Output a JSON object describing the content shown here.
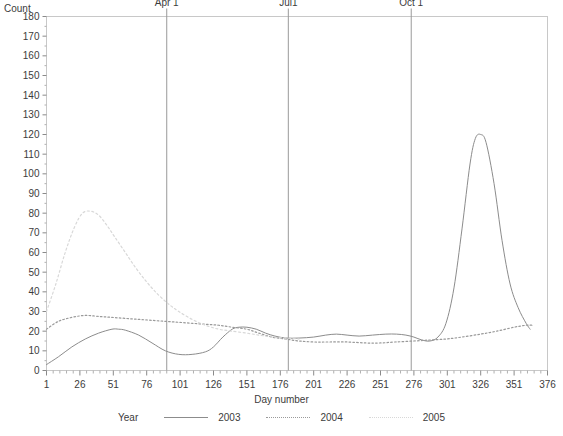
{
  "chart_data": {
    "type": "line",
    "title": "",
    "xlabel": "Day number",
    "ylabel": "Count",
    "xlim": [
      1,
      376
    ],
    "ylim": [
      0,
      180
    ],
    "grid": false,
    "legend_position": "bottom",
    "legend_title": "Year",
    "x_ticks": [
      1,
      26,
      51,
      76,
      101,
      126,
      151,
      176,
      201,
      226,
      251,
      276,
      301,
      326,
      351,
      376
    ],
    "y_ticks": [
      0,
      10,
      20,
      30,
      40,
      50,
      60,
      70,
      80,
      90,
      100,
      110,
      120,
      130,
      140,
      150,
      160,
      170,
      180
    ],
    "x_minor_step": 5,
    "reference_lines": [
      {
        "label": "Apr 1",
        "x": 91
      },
      {
        "label": "Jul1",
        "x": 182
      },
      {
        "label": "Oct 1",
        "x": 274
      }
    ],
    "series": [
      {
        "name": "2003",
        "style": "solid",
        "color": "#8c8c8c",
        "x": [
          1,
          10,
          20,
          30,
          40,
          50,
          55,
          60,
          70,
          80,
          90,
          100,
          110,
          120,
          126,
          133,
          140,
          145,
          151,
          158,
          165,
          172,
          180,
          190,
          201,
          210,
          218,
          226,
          235,
          245,
          255,
          263,
          270,
          276,
          282,
          288,
          294,
          300,
          306,
          312,
          318,
          322,
          326,
          330,
          336,
          342,
          348,
          354,
          360,
          363
        ],
        "values": [
          3,
          7,
          12,
          16,
          19,
          21,
          21,
          20.5,
          18,
          14,
          10,
          8.2,
          8.2,
          9.5,
          12,
          17,
          21,
          22,
          22,
          21,
          19,
          17.5,
          16.5,
          16.5,
          17,
          18,
          18.5,
          18,
          17.5,
          18,
          18.5,
          18.5,
          18,
          17,
          15.5,
          15,
          17,
          24,
          42,
          72,
          105,
          118,
          120,
          116,
          95,
          66,
          44,
          32,
          24,
          21
        ]
      },
      {
        "name": "2004",
        "style": "dotted",
        "color": "#9a9a9a",
        "x": [
          1,
          10,
          20,
          30,
          40,
          50,
          60,
          70,
          80,
          90,
          100,
          110,
          120,
          130,
          140,
          151,
          160,
          170,
          180,
          190,
          201,
          212,
          226,
          240,
          251,
          262,
          276,
          288,
          300,
          312,
          326,
          338,
          351,
          360,
          365
        ],
        "values": [
          21,
          25,
          27,
          28,
          27.5,
          27,
          26.5,
          26,
          25.5,
          25,
          24.5,
          24,
          23.5,
          23,
          22,
          21,
          19,
          17,
          16,
          15,
          14.5,
          14.5,
          14.5,
          14,
          14,
          14.5,
          15,
          15.5,
          16,
          17,
          18.5,
          20,
          22,
          23,
          23
        ]
      },
      {
        "name": "2005",
        "style": "dotted-light",
        "color": "#d8d8d8",
        "x": [
          1,
          8,
          15,
          22,
          28,
          34,
          40,
          46,
          52,
          60,
          68,
          76,
          84,
          92,
          100,
          110,
          120,
          130,
          140,
          151,
          160,
          170,
          180,
          190
        ],
        "values": [
          30,
          44,
          60,
          73,
          80,
          81,
          79,
          74,
          68,
          60,
          52,
          45,
          39,
          34,
          30,
          26,
          23,
          21,
          20,
          19,
          18,
          17,
          16.5,
          16
        ]
      }
    ]
  }
}
